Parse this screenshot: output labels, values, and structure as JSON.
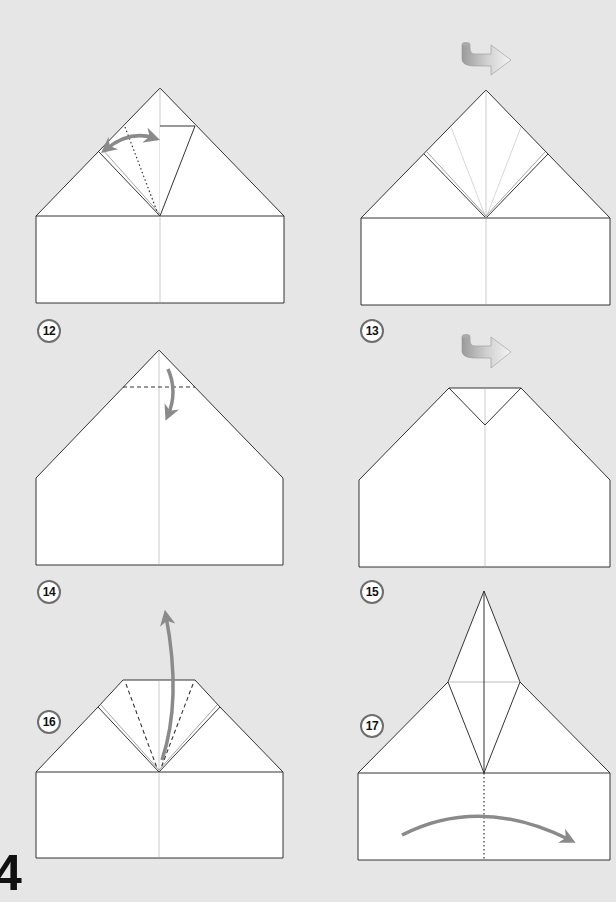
{
  "page": {
    "page_number": "4",
    "background_color": "#e6e6e6",
    "paper_color": "#ffffff",
    "line_color": "#333333",
    "arrow_color": "#8a8a8a"
  },
  "steps": [
    {
      "label": "12",
      "instruction_icons": [
        "valley-fold-dotted-line",
        "double-arrow-fold-unfold"
      ]
    },
    {
      "label": "13",
      "instruction_icons": [
        "turn-over-arrow"
      ]
    },
    {
      "label": "14",
      "instruction_icons": [
        "valley-fold-dashed-line",
        "fold-down-arrow"
      ]
    },
    {
      "label": "15",
      "instruction_icons": [
        "turn-over-arrow"
      ]
    },
    {
      "label": "16",
      "instruction_icons": [
        "valley-fold-dashed-lines",
        "fold-up-arrow"
      ]
    },
    {
      "label": "17",
      "instruction_icons": [
        "center-dotted-line",
        "fold-in-half-arrow"
      ]
    }
  ]
}
